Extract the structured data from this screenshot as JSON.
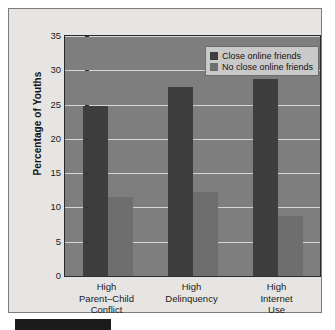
{
  "chart_data": {
    "type": "bar",
    "title": "",
    "subtitle": "",
    "xlabel": "",
    "ylabel": "Percentage of Youths",
    "ylim": [
      0,
      35
    ],
    "ytick_step": 5,
    "yticks": [
      0,
      5,
      10,
      15,
      20,
      25,
      30,
      35
    ],
    "ytick_labels": [
      "0",
      "5",
      "10",
      "15",
      "20",
      "25",
      "30",
      "35"
    ],
    "grid": true,
    "grid_axis": "y",
    "legend_position": "top-right",
    "categories": [
      "High\nParent–Child\nConflict",
      "High\nDelinquency",
      "High\nInternet\nUse"
    ],
    "category_lines": [
      [
        "High",
        "Parent–Child",
        "Conflict"
      ],
      [
        "High",
        "Delinquency"
      ],
      [
        "High",
        "Internet",
        "Use"
      ]
    ],
    "series": [
      {
        "name": "Close online friends",
        "color": "#3e3e3e",
        "values": [
          24.8,
          27.6,
          28.7
        ]
      },
      {
        "name": "No close online friends",
        "color": "#6e6e6e",
        "values": [
          11.5,
          12.3,
          8.8
        ]
      }
    ]
  },
  "legend": {
    "items": [
      {
        "label": "Close online friends",
        "swatch": "#3e3e3e"
      },
      {
        "label": "No close online friends",
        "swatch": "#6e6e6e"
      }
    ]
  },
  "axis": {
    "y_title": "Percentage of Youths"
  },
  "colors": {
    "plot_background": "#7e7e7e",
    "figure_background": "#e6e5e3",
    "gridline": "#d6d6d6",
    "axis_line": "#2b2b2b",
    "series_close": "#3e3e3e",
    "series_no_close": "#6e6e6e",
    "legend_background": "#c9c9c9",
    "caption_rule": "#1b1b1b"
  }
}
